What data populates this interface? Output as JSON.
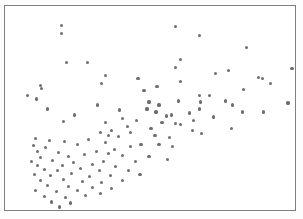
{
  "figure": {
    "background_color": "#fdfdfd",
    "plot_background_color": "#ffffff",
    "frame_color": "#808080",
    "marker_color": "#6e6e6e"
  },
  "chart_data": {
    "type": "scatter",
    "title": "",
    "subtitle": "",
    "xlabel": "",
    "ylabel": "",
    "xlim": [
      0,
      292
    ],
    "ylim": [
      0,
      206
    ],
    "grid": false,
    "legend": null,
    "tick_labels": {
      "x": [],
      "y": []
    },
    "annotations": [],
    "marker": {
      "shape": "circle",
      "size_px": 3.2,
      "color": "#6e6e6e"
    },
    "n_points": 131,
    "series": [
      {
        "name": "observations",
        "points": [
          [
            57,
            20
          ],
          [
            57,
            28
          ],
          [
            172,
            21
          ],
          [
            196,
            30
          ],
          [
            243,
            42
          ],
          [
            308,
            46
          ],
          [
            62,
            57
          ],
          [
            83,
            57
          ],
          [
            177,
            54
          ],
          [
            172,
            62
          ],
          [
            225,
            65
          ],
          [
            101,
            70
          ],
          [
            289,
            63
          ],
          [
            212,
            68
          ],
          [
            255,
            72
          ],
          [
            36,
            80
          ],
          [
            97,
            78
          ],
          [
            37,
            83
          ],
          [
            134,
            73
          ],
          [
            177,
            76
          ],
          [
            259,
            73
          ],
          [
            23,
            90
          ],
          [
            153,
            81
          ],
          [
            196,
            90
          ],
          [
            267,
            78
          ],
          [
            240,
            84
          ],
          [
            313,
            82
          ],
          [
            32,
            94
          ],
          [
            140,
            85
          ],
          [
            197,
            97
          ],
          [
            222,
            96
          ],
          [
            206,
            90
          ],
          [
            313,
            69
          ],
          [
            43,
            104
          ],
          [
            93,
            100
          ],
          [
            155,
            100
          ],
          [
            175,
            96
          ],
          [
            196,
            104
          ],
          [
            229,
            100
          ],
          [
            70,
            110
          ],
          [
            115,
            105
          ],
          [
            145,
            97
          ],
          [
            143,
            104
          ],
          [
            152,
            107
          ],
          [
            163,
            111
          ],
          [
            186,
            108
          ],
          [
            210,
            112
          ],
          [
            285,
            98
          ],
          [
            59,
            117
          ],
          [
            118,
            114
          ],
          [
            168,
            110
          ],
          [
            190,
            116
          ],
          [
            239,
            107
          ],
          [
            260,
            107
          ],
          [
            101,
            118
          ],
          [
            132,
            116
          ],
          [
            158,
            118
          ],
          [
            172,
            119
          ],
          [
            123,
            122
          ],
          [
            177,
            120
          ],
          [
            96,
            128
          ],
          [
            107,
            126
          ],
          [
            126,
            128
          ],
          [
            147,
            124
          ],
          [
            198,
            129
          ],
          [
            228,
            124
          ],
          [
            31,
            134
          ],
          [
            104,
            131
          ],
          [
            114,
            132
          ],
          [
            151,
            131
          ],
          [
            166,
            133
          ],
          [
            189,
            126
          ],
          [
            45,
            136
          ],
          [
            60,
            137
          ],
          [
            84,
            135
          ],
          [
            101,
            138
          ],
          [
            137,
            140
          ],
          [
            155,
            140
          ],
          [
            29,
            141
          ],
          [
            41,
            143
          ],
          [
            73,
            140
          ],
          [
            110,
            145
          ],
          [
            126,
            142
          ],
          [
            33,
            147
          ],
          [
            54,
            148
          ],
          [
            92,
            147
          ],
          [
            104,
            149
          ],
          [
            169,
            142
          ],
          [
            36,
            153
          ],
          [
            64,
            152
          ],
          [
            80,
            150
          ],
          [
            118,
            151
          ],
          [
            145,
            152
          ],
          [
            27,
            157
          ],
          [
            48,
            156
          ],
          [
            69,
            158
          ],
          [
            99,
            157
          ],
          [
            131,
            157
          ],
          [
            164,
            155
          ],
          [
            33,
            161
          ],
          [
            58,
            161
          ],
          [
            88,
            160
          ],
          [
            111,
            162
          ],
          [
            40,
            165
          ],
          [
            53,
            166
          ],
          [
            76,
            164
          ],
          [
            95,
            166
          ],
          [
            124,
            166
          ],
          [
            30,
            170
          ],
          [
            46,
            171
          ],
          [
            67,
            169
          ],
          [
            85,
            172
          ],
          [
            106,
            171
          ],
          [
            136,
            170
          ],
          [
            36,
            176
          ],
          [
            59,
            175
          ],
          [
            78,
            177
          ],
          [
            97,
            178
          ],
          [
            118,
            176
          ],
          [
            43,
            181
          ],
          [
            64,
            182
          ],
          [
            88,
            183
          ],
          [
            107,
            184
          ],
          [
            31,
            186
          ],
          [
            52,
            187
          ],
          [
            73,
            186
          ],
          [
            96,
            189
          ],
          [
            40,
            192
          ],
          [
            61,
            193
          ],
          [
            81,
            191
          ],
          [
            47,
            198
          ],
          [
            66,
            199
          ],
          [
            55,
            203
          ]
        ]
      }
    ]
  }
}
